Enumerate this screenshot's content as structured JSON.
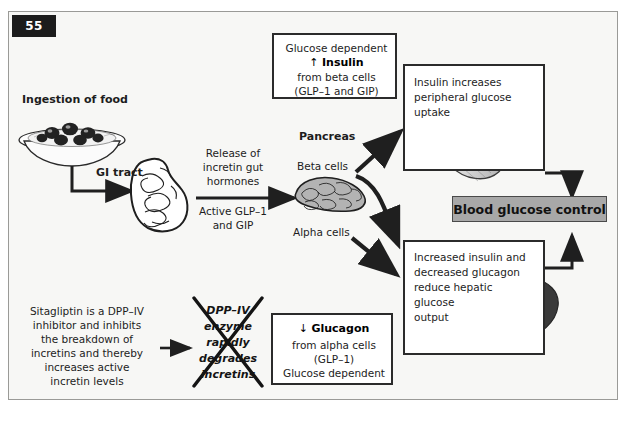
{
  "page": {
    "number": "55"
  },
  "figure": {
    "type": "flow-diagram"
  },
  "labels": {
    "ingestion": "Ingestion of food",
    "gi_tract": "GI tract",
    "release_line1": "Release of",
    "release_line2": "incretin gut",
    "release_line3": "hormones",
    "active_line1": "Active GLP–1",
    "active_line2": "and GIP",
    "pancreas": "Pancreas",
    "beta_cells": "Beta cells",
    "alpha_cells": "Alpha cells"
  },
  "insulin_box": {
    "line1": "Glucose dependent",
    "line2_arrow": "↑",
    "line2_term": "Insulin",
    "line3": "from beta cells",
    "line4": "(GLP–1 and GIP)"
  },
  "glucagon_box": {
    "line1_arrow": "↓",
    "line1_term": "Glucagon",
    "line2": "from alpha cells",
    "line3": "(GLP–1)",
    "line4": "Glucose dependent"
  },
  "muscle_box": {
    "line1": "Insulin increases",
    "line2": "peripheral glucose",
    "line3": "uptake",
    "organ": "skeletal-muscle"
  },
  "liver_box": {
    "line1": "Increased insulin and",
    "line2": "decreased glucagon",
    "line3": "reduce hepatic",
    "line4": "glucose",
    "line5": "output",
    "organ": "liver"
  },
  "outcome": {
    "label": "Blood glucose control"
  },
  "sitagliptin": {
    "line1": "Sitagliptin is a DPP–IV",
    "line2": "inhibitor and inhibits",
    "line3": "the breakdown of",
    "line4": "incretins and thereby",
    "line5": "increases active",
    "line6": "incretin levels"
  },
  "dpp_blocked": {
    "line1": "DPP–IV",
    "line2": "enzyme",
    "line3": "rapidly",
    "line4": "degrades",
    "line5": "incretins",
    "struck_through": true
  },
  "colors": {
    "frame_bg": "#f7f7f5",
    "frame_border": "#9a9a97",
    "ink": "#1d1d1d",
    "box_border": "#2b2b2b",
    "outcome_fill": "#a8a8a8",
    "pancreas_fill": "#b3b3b3",
    "liver_fill": "#3a3a3a",
    "badge_bg": "#1c1c1c"
  }
}
